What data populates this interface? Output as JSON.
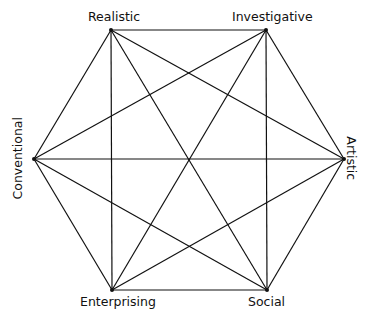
{
  "diagram": {
    "stroke_color": "#111111",
    "vertices": [
      {
        "id": "R",
        "label": "Realistic",
        "x": 111,
        "y": 30
      },
      {
        "id": "I",
        "label": "Investigative",
        "x": 266,
        "y": 30
      },
      {
        "id": "A",
        "label": "Artistic",
        "x": 344,
        "y": 159
      },
      {
        "id": "S",
        "label": "Social",
        "x": 267,
        "y": 290
      },
      {
        "id": "E",
        "label": "Enterprising",
        "x": 112,
        "y": 290
      },
      {
        "id": "C",
        "label": "Conventional",
        "x": 34,
        "y": 159
      }
    ],
    "edges": [
      [
        "R",
        "I"
      ],
      [
        "I",
        "A"
      ],
      [
        "A",
        "S"
      ],
      [
        "S",
        "E"
      ],
      [
        "E",
        "C"
      ],
      [
        "C",
        "R"
      ],
      [
        "R",
        "A"
      ],
      [
        "R",
        "S"
      ],
      [
        "R",
        "E"
      ],
      [
        "I",
        "S"
      ],
      [
        "I",
        "E"
      ],
      [
        "I",
        "C"
      ],
      [
        "A",
        "E"
      ],
      [
        "A",
        "C"
      ],
      [
        "S",
        "C"
      ]
    ]
  }
}
